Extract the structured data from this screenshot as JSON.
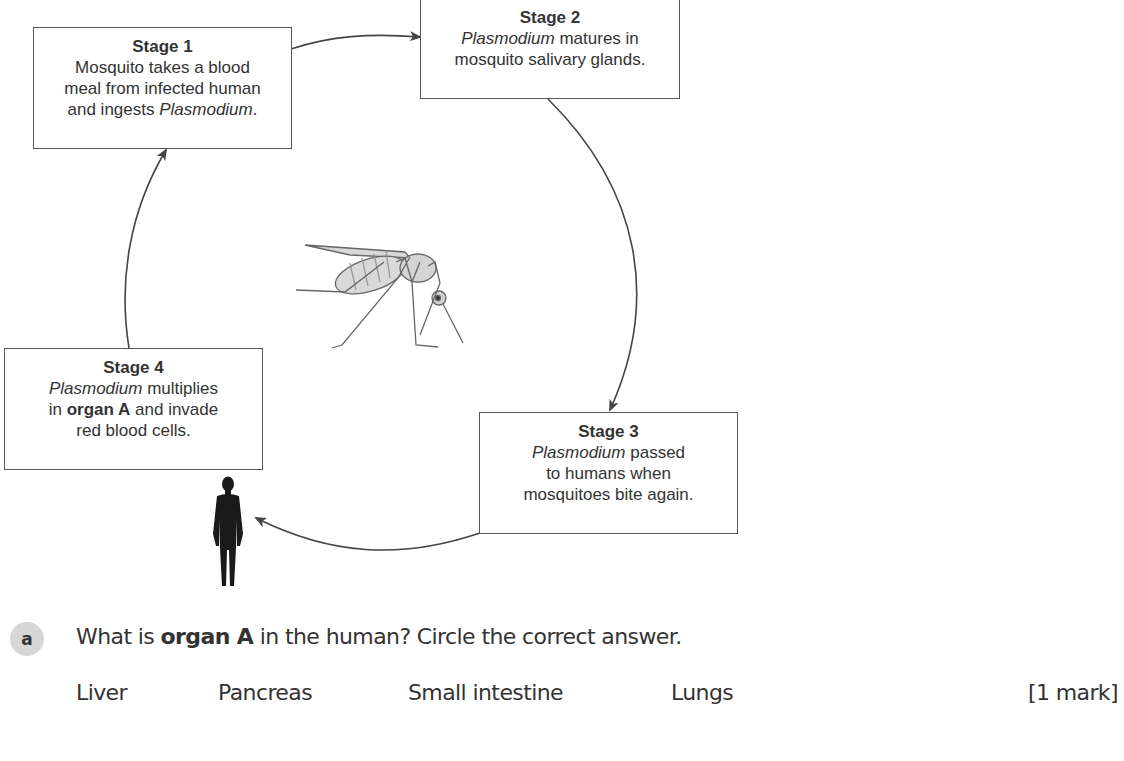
{
  "diagram": {
    "type": "life-cycle",
    "stages": [
      {
        "title": "Stage 1",
        "lines": [
          [
            {
              "t": "Mosquito takes a blood"
            }
          ],
          [
            {
              "t": "meal from infected human"
            }
          ],
          [
            {
              "t": "and ingests "
            },
            {
              "t": "Plasmodium",
              "style": "italic"
            },
            {
              "t": "."
            }
          ]
        ]
      },
      {
        "title": "Stage 2",
        "lines": [
          [
            {
              "t": "Plasmodium",
              "style": "italic"
            },
            {
              "t": " matures in"
            }
          ],
          [
            {
              "t": "mosquito salivary glands."
            }
          ]
        ]
      },
      {
        "title": "Stage 3",
        "lines": [
          [
            {
              "t": "Plasmodium",
              "style": "italic"
            },
            {
              "t": " passed"
            }
          ],
          [
            {
              "t": "to humans when"
            }
          ],
          [
            {
              "t": "mosquitoes bite again."
            }
          ]
        ]
      },
      {
        "title": "Stage 4",
        "lines": [
          [
            {
              "t": "Plasmodium",
              "style": "italic"
            },
            {
              "t": " multiplies"
            }
          ],
          [
            {
              "t": "in "
            },
            {
              "t": "organ A",
              "style": "bold"
            },
            {
              "t": " and invade"
            }
          ],
          [
            {
              "t": "red blood cells."
            }
          ]
        ]
      }
    ],
    "flow": [
      "Stage 1 → Stage 2",
      "Stage 2 → Stage 3",
      "Stage 3 → human",
      "Stage 4 → Stage 1"
    ],
    "illustrations": [
      "mosquito-icon",
      "human-silhouette-icon"
    ]
  },
  "question": {
    "label": "a",
    "text_parts": [
      {
        "t": "What is "
      },
      {
        "t": "organ A",
        "style": "bold"
      },
      {
        "t": " in the human? Circle the correct answer."
      }
    ],
    "options": [
      "Liver",
      "Pancreas",
      "Small intestine",
      "Lungs"
    ],
    "marks": "[1 mark]"
  },
  "colors": {
    "box_border": "#555555",
    "arrow": "#444444",
    "text": "#333333",
    "badge_bg": "#d6d6d6",
    "silhouette": "#1a1a1a"
  }
}
